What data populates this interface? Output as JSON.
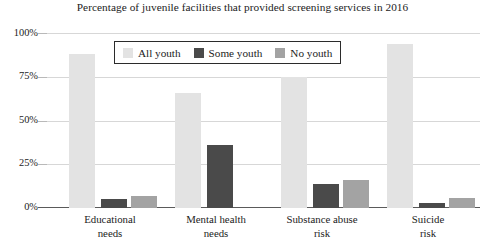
{
  "chart_data": {
    "type": "bar",
    "title": "Percentage of juvenile facilities that provided screening services in 2016",
    "xlabel": "",
    "ylabel": "",
    "ylim": [
      0,
      100
    ],
    "ytick_labels": [
      "0%",
      "25%",
      "50%",
      "75%",
      "100%"
    ],
    "ytick_values": [
      0,
      25,
      50,
      75,
      100
    ],
    "grid": true,
    "legend_position": "inside-top-left",
    "categories": [
      "Educational needs",
      "Mental health needs",
      "Substance abuse risk",
      "Suicide risk"
    ],
    "category_lines": [
      [
        "Educational",
        "needs"
      ],
      [
        "Mental health",
        "needs"
      ],
      [
        "Substance abuse",
        "risk"
      ],
      [
        "Suicide",
        "risk"
      ]
    ],
    "series": [
      {
        "name": "All youth",
        "color": "#e3e3e3",
        "values": [
          88,
          66,
          75,
          94
        ]
      },
      {
        "name": "Some youth",
        "color": "#4a4a4a",
        "values": [
          5,
          36,
          14,
          3
        ]
      },
      {
        "name": "No youth",
        "color": "#a3a3a3",
        "values": [
          7,
          0,
          16,
          6
        ]
      }
    ]
  },
  "legend": {
    "items": [
      {
        "label": "All youth",
        "color": "#e3e3e3"
      },
      {
        "label": "Some youth",
        "color": "#4a4a4a"
      },
      {
        "label": "No youth",
        "color": "#a3a3a3"
      }
    ]
  },
  "axis": {
    "y_labels": [
      "100%",
      "75%",
      "50%",
      "25%",
      "0%"
    ]
  }
}
